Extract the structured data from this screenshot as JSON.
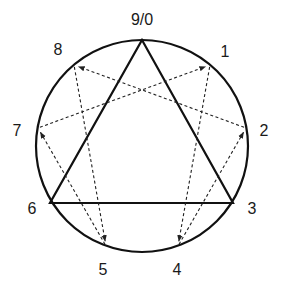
{
  "diagram": {
    "circle": {
      "cx": 142,
      "cy": 146,
      "r": 106,
      "stroke": "#111111"
    },
    "points": [
      {
        "id": "9",
        "label": "9/0",
        "x": 142,
        "y": 40,
        "lx": 142,
        "ly": 20
      },
      {
        "id": "1",
        "label": "1",
        "x": 210,
        "y": 65,
        "lx": 225,
        "ly": 52
      },
      {
        "id": "2",
        "label": "2",
        "x": 246,
        "y": 128,
        "lx": 264,
        "ly": 131
      },
      {
        "id": "3",
        "label": "3",
        "x": 233,
        "y": 203,
        "lx": 252,
        "ly": 209
      },
      {
        "id": "4",
        "label": "4",
        "x": 178,
        "y": 246,
        "lx": 177,
        "ly": 270
      },
      {
        "id": "5",
        "label": "5",
        "x": 106,
        "y": 246,
        "lx": 103,
        "ly": 270
      },
      {
        "id": "6",
        "label": "6",
        "x": 50,
        "y": 203,
        "lx": 32,
        "ly": 209
      },
      {
        "id": "7",
        "label": "7",
        "x": 38,
        "y": 128,
        "lx": 17,
        "ly": 131
      },
      {
        "id": "8",
        "label": "8",
        "x": 74,
        "y": 65,
        "lx": 58,
        "ly": 50
      }
    ],
    "triangle": {
      "vertices": [
        "9",
        "3",
        "6"
      ],
      "stroke": "#111111"
    },
    "hexad_arrows": [
      {
        "from": "7",
        "to": "1"
      },
      {
        "from": "1",
        "to": "4"
      },
      {
        "from": "4",
        "to": "2"
      },
      {
        "from": "2",
        "to": "8"
      },
      {
        "from": "8",
        "to": "5"
      },
      {
        "from": "5",
        "to": "7"
      }
    ],
    "arrow_style": {
      "stroke": "#222222",
      "dash": "3,2.5"
    }
  }
}
